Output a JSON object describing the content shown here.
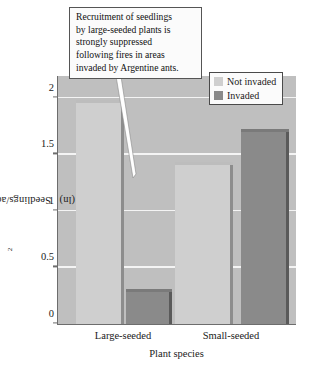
{
  "chart_data": {
    "type": "bar",
    "title": "",
    "subtitle": "",
    "xlabel": "Plant species",
    "ylabel": "Seedlings/adult plant/m² (ln)",
    "ylabel_parts": {
      "pre": "Seedlings/adult plant/m",
      "sup": "2",
      "post": " (ln)"
    },
    "categories": [
      "Large-seeded",
      "Small-seeded"
    ],
    "series": [
      {
        "name": "Not invaded",
        "color": "#cfcfcf",
        "values": [
          1.98,
          1.43
        ]
      },
      {
        "name": "Invaded",
        "color": "#8a8a8a",
        "values": [
          0.31,
          1.73
        ]
      }
    ],
    "ylim": [
      0,
      2.2
    ],
    "yticks": [
      0,
      0.5,
      1,
      1.5,
      2
    ],
    "ytick_labels": [
      "0",
      "0.5",
      "1",
      "1.5",
      "2"
    ],
    "grid": true,
    "gridlines_at": [
      0.5,
      1,
      1.5,
      2
    ],
    "legend_position": "top-right",
    "plot_background": "#bfbfbf",
    "gridline_color": "#f4f4f4",
    "annotations": [
      {
        "text": "Recruitment of seedlings by large-seeded plants is strongly suppressed following fires in areas invaded by Argentine ants.",
        "lines": [
          "Recruitment of seedlings",
          "by large-seeded plants is",
          "strongly suppressed",
          "following fires in areas",
          "invaded by Argentine ants."
        ],
        "points_to": "Large-seeded / Invaded bar"
      }
    ]
  },
  "legend": {
    "items": [
      {
        "label": "Not invaded",
        "swatch": "light"
      },
      {
        "label": "Invaded",
        "swatch": "dark"
      }
    ]
  },
  "axes": {
    "y": {
      "label_pre": "Seedlings/adult plant/m",
      "label_sup": "2",
      "label_post": " (ln)",
      "ticks": [
        "0",
        "0.5",
        "1",
        "1.5",
        "2"
      ]
    },
    "x": {
      "label": "Plant species",
      "ticks": [
        "Large-seeded",
        "Small-seeded"
      ]
    }
  }
}
